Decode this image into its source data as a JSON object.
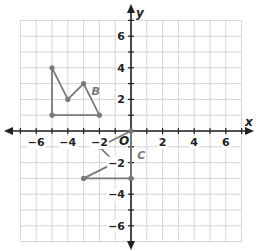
{
  "diagram": {
    "type": "coordinate-plane",
    "x_axis_label": "x",
    "y_axis_label": "y",
    "origin_label": "O",
    "x_range": [
      -7,
      7
    ],
    "y_range": [
      -7,
      7
    ],
    "grid_spacing": 1,
    "x_tick_labels": [
      {
        "value": -6,
        "text": "−6"
      },
      {
        "value": -4,
        "text": "−4"
      },
      {
        "value": -2,
        "text": "−2"
      },
      {
        "value": 2,
        "text": "2"
      },
      {
        "value": 4,
        "text": "4"
      },
      {
        "value": 6,
        "text": "6"
      }
    ],
    "y_tick_labels": [
      {
        "value": 6,
        "text": "6"
      },
      {
        "value": 4,
        "text": "4"
      },
      {
        "value": 2,
        "text": "2"
      },
      {
        "value": -2,
        "text": "−2"
      },
      {
        "value": -4,
        "text": "−4"
      },
      {
        "value": -6,
        "text": "−6"
      }
    ],
    "figures": [
      {
        "name": "B",
        "label_pos": [
          -2.5,
          2.3
        ],
        "vertices": [
          [
            -5,
            4
          ],
          [
            -4,
            2
          ],
          [
            -3,
            3
          ],
          [
            -2,
            1
          ],
          [
            -5,
            1
          ]
        ],
        "closed": true
      },
      {
        "name": "C",
        "label_pos": [
          0.4,
          -1.8
        ],
        "vertices": [
          [
            0,
            0
          ],
          [
            -2,
            -1
          ],
          [
            -1,
            -2
          ],
          [
            -3,
            -3
          ],
          [
            0,
            -3
          ]
        ],
        "closed": true
      }
    ],
    "colors": {
      "grid": "#d4d4d4",
      "axis": "#222222",
      "figure": "#7a7a7a"
    }
  }
}
